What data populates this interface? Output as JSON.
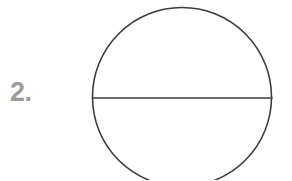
{
  "page": {
    "background_color": "#ffffff",
    "width": 292,
    "height": 180
  },
  "item": {
    "number_label": "2.",
    "number_color": "#9b9b9b"
  },
  "figure": {
    "name": "circle-with-horizontal-diameter",
    "stroke_color": "#3c3c3c",
    "stroke_width": 1.6,
    "fill": "none",
    "circle": {
      "center_x": 182,
      "center_y": 97,
      "radius": 89.5,
      "clipped_at_bottom": true
    },
    "diameter_line": {
      "x1": 93,
      "y1": 98,
      "x2": 272,
      "y2": 98,
      "orientation": "horizontal"
    }
  }
}
